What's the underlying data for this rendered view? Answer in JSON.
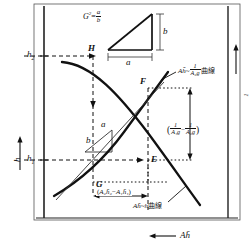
{
  "figure": {
    "type": "engineering-construction-graph"
  },
  "axes": {
    "y_label": "h",
    "x_label": "Ah̄",
    "x_arrow": "←",
    "y_arrow": "↑",
    "right_label_num": "1",
    "right_label_den": "Ag",
    "right_arrow": "↑"
  },
  "ticks": {
    "y": [
      {
        "id": "h2",
        "base": "h",
        "sub": "2"
      },
      {
        "id": "h1",
        "base": "h",
        "sub": "1"
      }
    ]
  },
  "points": {
    "H": "H",
    "F": "F",
    "E": "E",
    "G": "G"
  },
  "slope_triangle": {
    "formula_base": "G",
    "formula_exp": "2",
    "formula_eq": "=",
    "frac_num": "a",
    "frac_den": "b",
    "side_a": "a",
    "side_b": "b"
  },
  "inner_triangle": {
    "side_a": "a",
    "side_b": "b"
  },
  "annotations": {
    "curve_upper": {
      "prefix": "A",
      "hbar": "h̄",
      "tilde": "~",
      "frac_num": "1",
      "frac_den": "A₂g",
      "suffix": "曲線"
    },
    "curve_lower": {
      "prefix": "A",
      "hbar": "h̄",
      "tilde": "~",
      "var": "h",
      "suffix": "曲線"
    },
    "bracket_right": {
      "open": "(",
      "frac1_num": "1",
      "frac1_den": "A₁g",
      "minus": "−",
      "frac2_num": "1",
      "frac2_den": "A₂g",
      "close": ")"
    },
    "span_bottom": {
      "open": "(",
      "t1": "A₂h̄₂",
      "minus": "−",
      "t2": "A₁h̄₁",
      "close": ")"
    }
  },
  "colors": {
    "ink": "#111111",
    "paper": "#ffffff",
    "thin": "#333333"
  }
}
